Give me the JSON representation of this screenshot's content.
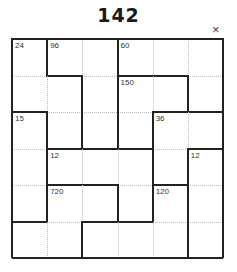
{
  "title": "142",
  "close_icon": "×",
  "grid": {
    "rows": 6,
    "cols": 6,
    "cages": [
      {
        "clue": "24",
        "cells": [
          [
            0,
            0
          ],
          [
            1,
            0
          ],
          [
            1,
            1
          ],
          [
            2,
            1
          ]
        ]
      },
      {
        "clue": "96",
        "cells": [
          [
            0,
            1
          ],
          [
            0,
            2
          ],
          [
            1,
            2
          ],
          [
            2,
            2
          ]
        ]
      },
      {
        "clue": "60",
        "cells": [
          [
            0,
            3
          ],
          [
            0,
            4
          ],
          [
            0,
            5
          ],
          [
            1,
            5
          ]
        ]
      },
      {
        "clue": "150",
        "cells": [
          [
            1,
            3
          ],
          [
            1,
            4
          ],
          [
            2,
            3
          ]
        ]
      },
      {
        "clue": "15",
        "cells": [
          [
            2,
            0
          ],
          [
            3,
            0
          ],
          [
            4,
            0
          ]
        ]
      },
      {
        "clue": "36",
        "cells": [
          [
            2,
            4
          ],
          [
            2,
            5
          ],
          [
            3,
            4
          ]
        ]
      },
      {
        "clue": "12",
        "cells": [
          [
            3,
            1
          ],
          [
            3,
            2
          ],
          [
            3,
            3
          ],
          [
            4,
            3
          ]
        ]
      },
      {
        "clue": "12",
        "cells": [
          [
            3,
            5
          ],
          [
            4,
            5
          ],
          [
            5,
            5
          ]
        ]
      },
      {
        "clue": "720",
        "cells": [
          [
            4,
            1
          ],
          [
            4,
            2
          ],
          [
            5,
            1
          ],
          [
            5,
            0
          ]
        ]
      },
      {
        "clue": "120",
        "cells": [
          [
            4,
            4
          ],
          [
            5,
            4
          ],
          [
            5,
            3
          ],
          [
            5,
            2
          ]
        ]
      }
    ]
  }
}
